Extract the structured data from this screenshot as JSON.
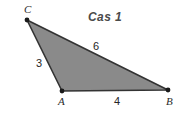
{
  "figure": {
    "title": "Cas 1",
    "background_color": "#ffffff",
    "fill_color": "#8a8a8a",
    "stroke_color": "#333333",
    "label_color": "#2b2b2b",
    "title_color": "#4a4a4a"
  },
  "vertices": [
    {
      "name": "C",
      "label": "C",
      "x": 27,
      "y": 20
    },
    {
      "name": "A",
      "label": "A",
      "x": 62,
      "y": 91
    },
    {
      "name": "B",
      "label": "B",
      "x": 168,
      "y": 90
    }
  ],
  "sides": [
    {
      "name": "CA",
      "label": "3",
      "from": "C",
      "to": "A"
    },
    {
      "name": "CB",
      "label": "6",
      "from": "C",
      "to": "B"
    },
    {
      "name": "AB",
      "label": "4",
      "from": "A",
      "to": "B"
    }
  ],
  "chart_data": {
    "type": "diagram",
    "title": "Cas 1",
    "shape": "triangle",
    "points": {
      "C": [
        27,
        20
      ],
      "A": [
        62,
        91
      ],
      "B": [
        168,
        90
      ]
    },
    "edge_lengths": {
      "CA": 3,
      "CB": 6,
      "AB": 4
    },
    "vertex_labels": [
      "C",
      "A",
      "B"
    ],
    "edge_labels": [
      "3",
      "6",
      "4"
    ],
    "fill": "#8a8a8a",
    "stroke": "#333333"
  }
}
